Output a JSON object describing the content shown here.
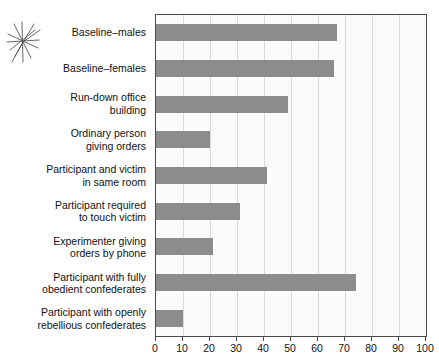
{
  "figure": {
    "decoration": "starburst-mark",
    "bar_color": "#8c8c8c",
    "axis_color": "#4a4a4a",
    "grid_color": "#d9d9d9",
    "plot_background": "#fbfbfb"
  },
  "chart_data": {
    "type": "bar",
    "orientation": "horizontal",
    "title": "",
    "subtitle": "",
    "xlabel": "",
    "ylabel": "",
    "xlim": [
      0,
      100
    ],
    "grid": true,
    "legend": false,
    "legend_position": "none",
    "xticks": [
      0,
      10,
      20,
      30,
      40,
      50,
      60,
      70,
      80,
      90,
      100
    ],
    "xtick_labels": [
      "0",
      "10",
      "20",
      "30",
      "40",
      "50",
      "60",
      "70",
      "80",
      "90",
      "100"
    ],
    "categories": [
      "Baseline–males",
      "Baseline–females",
      "Run-down office building",
      "Ordinary person giving orders",
      "Participant and victim in same room",
      "Participant required to touch victim",
      "Experimenter giving orders by phone",
      "Participant with fully obedient confederates",
      "Participant with openly rebellious confederates"
    ],
    "category_lines": [
      [
        "Baseline–males"
      ],
      [
        "Baseline–females"
      ],
      [
        "Run-down office",
        "building"
      ],
      [
        "Ordinary person",
        "giving orders"
      ],
      [
        "Participant and victim",
        "in same room"
      ],
      [
        "Participant required",
        "to touch victim"
      ],
      [
        "Experimenter giving",
        "orders by phone"
      ],
      [
        "Participant with fully",
        "obedient confederates"
      ],
      [
        "Participant with openly",
        "rebellious confederates"
      ]
    ],
    "values": [
      67,
      66,
      49,
      20,
      41,
      31,
      21,
      74,
      10
    ]
  }
}
